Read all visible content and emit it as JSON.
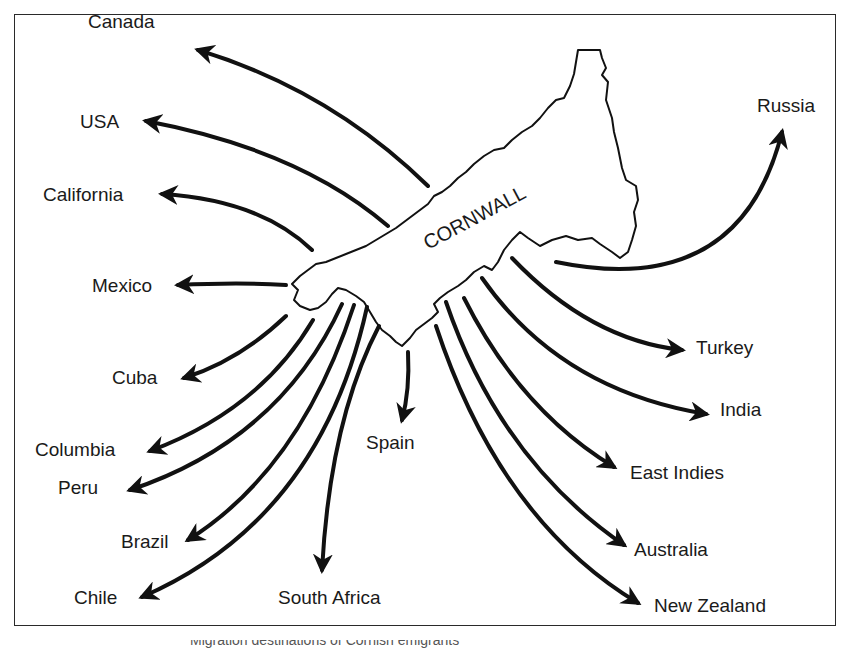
{
  "map": {
    "region_label": "CORNWALL",
    "destinations": [
      {
        "name": "Canada",
        "x": 88,
        "y": 12
      },
      {
        "name": "USA",
        "x": 80,
        "y": 84
      },
      {
        "name": "California",
        "x": 43,
        "y": 157
      },
      {
        "name": "Mexico",
        "x": 92,
        "y": 226
      },
      {
        "name": "Cuba",
        "x": 112,
        "y": 318
      },
      {
        "name": "Columbia",
        "x": 35,
        "y": 390
      },
      {
        "name": "Peru",
        "x": 58,
        "y": 428
      },
      {
        "name": "Brazil",
        "x": 121,
        "y": 482
      },
      {
        "name": "Chile",
        "x": 74,
        "y": 538
      },
      {
        "name": "South Africa",
        "x": 278,
        "y": 538
      },
      {
        "name": "Spain",
        "x": 366,
        "y": 383
      },
      {
        "name": "New Zealand",
        "x": 654,
        "y": 546
      },
      {
        "name": "Australia",
        "x": 634,
        "y": 490
      },
      {
        "name": "East Indies",
        "x": 630,
        "y": 413
      },
      {
        "name": "India",
        "x": 720,
        "y": 350
      },
      {
        "name": "Turkey",
        "x": 696,
        "y": 288
      },
      {
        "name": "Russia",
        "x": 757,
        "y": 46
      }
    ],
    "caption": "Migration destinations of Cornish emigrants"
  },
  "colors": {
    "ink": "#111111",
    "background": "#ffffff",
    "frame": "#2a2a2a"
  }
}
